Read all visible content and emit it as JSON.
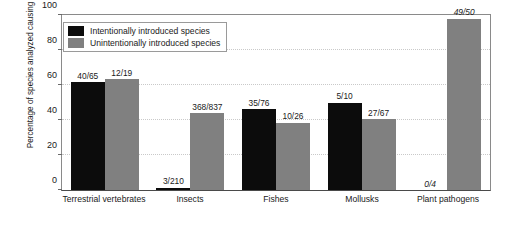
{
  "chart_data": {
    "type": "bar",
    "title": "",
    "xlabel": "",
    "ylabel": "Percentage of species analyzed causing harm",
    "ylim": [
      0,
      100
    ],
    "yticks": [
      0,
      20,
      40,
      60,
      80,
      100
    ],
    "grid": true,
    "legend_position": "top-left",
    "categories": [
      "Terrestrial vertebrates",
      "Insects",
      "Fishes",
      "Mollusks",
      "Plant pathogens"
    ],
    "series": [
      {
        "name": "Intentionally introduced species",
        "color": "#0c0c0c",
        "values": [
          61.5,
          1.4,
          46.1,
          50.0,
          0.0
        ],
        "labels": [
          "40/65",
          "3/210",
          "35/76",
          "5/10",
          "0/4"
        ],
        "label_italic": [
          false,
          false,
          false,
          false,
          true
        ]
      },
      {
        "name": "Unintentionally introduced species",
        "color": "#808080",
        "values": [
          63.2,
          44.0,
          38.5,
          40.3,
          98.0
        ],
        "labels": [
          "12/19",
          "368/837",
          "10/26",
          "27/67",
          "49/50"
        ],
        "label_italic": [
          false,
          false,
          false,
          false,
          true
        ]
      }
    ]
  },
  "legend": {
    "items": [
      {
        "label": "Intentionally introduced species",
        "swatch": "dark"
      },
      {
        "label": "Unintentionally introduced species",
        "swatch": "gray"
      }
    ]
  }
}
